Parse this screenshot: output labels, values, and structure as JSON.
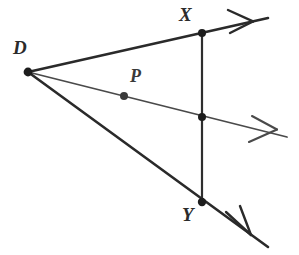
{
  "figure": {
    "kind": "geometry-diagram",
    "background_color": "#ffffff",
    "width": 299,
    "height": 255
  },
  "style": {
    "ray_color": "#2a2a2a",
    "middle_ray_color": "#4a4a4a",
    "transversal_color": "#2e2e2e",
    "dot_color": "#1d1d1d",
    "label_color": "#2b2b2b",
    "ray_width": 2.6,
    "middle_ray_width": 1.7,
    "transversal_width": 2.2
  },
  "points": [
    {
      "id": "D",
      "label": "D",
      "x": 28,
      "y": 72,
      "label_x": 13,
      "label_y": 38,
      "dot_r": 4.2,
      "marked": true
    },
    {
      "id": "X",
      "label": "X",
      "x": 202,
      "y": 33,
      "label_x": 178,
      "label_y": 4,
      "dot_r": 4.0,
      "marked": true
    },
    {
      "id": "P",
      "label": "P",
      "x": 124,
      "y": 96,
      "label_x": 129,
      "label_y": 66,
      "dot_r": 4.0,
      "marked": true
    },
    {
      "id": "M",
      "label": "",
      "x": 202,
      "y": 117,
      "label_x": 0,
      "label_y": 0,
      "dot_r": 4.0,
      "marked": true
    },
    {
      "id": "Y",
      "label": "Y",
      "x": 202,
      "y": 202,
      "label_x": 181,
      "label_y": 204,
      "dot_r": 4.2,
      "marked": true
    }
  ],
  "rays": [
    {
      "id": "top-ray",
      "from": "D",
      "through": "X",
      "start_x": 28,
      "start_y": 72,
      "end_x": 268,
      "end_y": 18,
      "arrow": true,
      "arrow_x": 252,
      "arrow_y": 22
    },
    {
      "id": "middle-ray",
      "from": "D",
      "through": "P",
      "start_x": 28,
      "start_y": 72,
      "end_x": 287,
      "end_y": 137,
      "arrow": true,
      "arrow_x": 272,
      "arrow_y": 133
    },
    {
      "id": "bottom-ray",
      "from": "D",
      "through": "Y",
      "start_x": 28,
      "start_y": 72,
      "end_x": 268,
      "end_y": 247,
      "arrow": true,
      "arrow_x": 250,
      "arrow_y": 234
    }
  ],
  "segments": [
    {
      "id": "transversal-xy",
      "from": "X",
      "to": "Y",
      "x1": 202,
      "y1": 33,
      "x2": 202,
      "y2": 202
    }
  ],
  "labels": {
    "d": "D",
    "x": "X",
    "p": "P",
    "y": "Y"
  }
}
